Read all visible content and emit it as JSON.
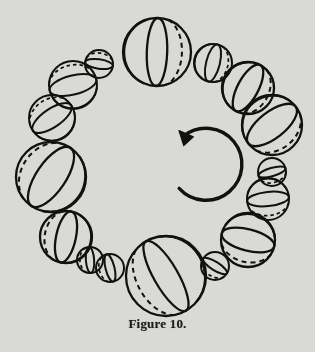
{
  "figure": {
    "caption": "Figure 10.",
    "title": "Figure 10.",
    "background_color": "#d9d9d6",
    "ink_color": "#111111",
    "rotation_arrow": {
      "name": "clockwise-rotation-arrow",
      "direction": "clockwise",
      "center_x": 157,
      "center_y": 160,
      "radius": 36,
      "gap_degrees": 40
    },
    "ring": {
      "center_x": 157,
      "center_y": 160,
      "radius": 110,
      "sphere_count": 20,
      "note": "Alternating large and small spheres; each sphere's great circle rotates progressively around the ring"
    },
    "spheres": [
      {
        "index": 0,
        "cx": 157,
        "cy": 52,
        "r": 34,
        "size": "large",
        "axis_tilt_deg": 2,
        "ellipse_ratio": 0.3,
        "second_line_ratio": 0.62,
        "label": "sphere-top-large"
      },
      {
        "index": 1,
        "cx": 213,
        "cy": 63,
        "r": 19,
        "size": "small",
        "axis_tilt_deg": 14,
        "ellipse_ratio": 0.36,
        "second_line_ratio": 0.7,
        "label": "sphere-small-1"
      },
      {
        "index": 2,
        "cx": 248,
        "cy": 88,
        "r": 26,
        "size": "large",
        "axis_tilt_deg": 28,
        "ellipse_ratio": 0.4,
        "second_line_ratio": 0.74,
        "label": "sphere-large-2"
      },
      {
        "index": 3,
        "cx": 272,
        "cy": 125,
        "r": 30,
        "size": "large",
        "axis_tilt_deg": 52,
        "ellipse_ratio": 0.44,
        "second_line_ratio": 0.78,
        "label": "sphere-large-3"
      },
      {
        "index": 4,
        "cx": 272,
        "cy": 172,
        "r": 14,
        "size": "small",
        "axis_tilt_deg": 74,
        "ellipse_ratio": 0.3,
        "second_line_ratio": 0.66,
        "label": "sphere-small-4"
      },
      {
        "index": 5,
        "cx": 268,
        "cy": 199,
        "r": 21,
        "size": "small",
        "axis_tilt_deg": 84,
        "ellipse_ratio": 0.34,
        "second_line_ratio": 0.7,
        "label": "sphere-small-5"
      },
      {
        "index": 6,
        "cx": 248,
        "cy": 240,
        "r": 27,
        "size": "large",
        "axis_tilt_deg": 104,
        "ellipse_ratio": 0.4,
        "second_line_ratio": 0.74,
        "label": "sphere-large-6"
      },
      {
        "index": 7,
        "cx": 215,
        "cy": 266,
        "r": 14,
        "size": "small",
        "axis_tilt_deg": 122,
        "ellipse_ratio": 0.3,
        "second_line_ratio": 0.66,
        "label": "sphere-small-7"
      },
      {
        "index": 8,
        "cx": 166,
        "cy": 276,
        "r": 40,
        "size": "large",
        "axis_tilt_deg": 150,
        "ellipse_ratio": 0.3,
        "second_line_ratio": 0.62,
        "label": "sphere-bottom-large"
      },
      {
        "index": 9,
        "cx": 110,
        "cy": 268,
        "r": 14,
        "size": "small",
        "axis_tilt_deg": 166,
        "ellipse_ratio": 0.32,
        "second_line_ratio": 0.68,
        "label": "sphere-small-9"
      },
      {
        "index": 10,
        "cx": 90,
        "cy": 260,
        "r": 13,
        "size": "small",
        "axis_tilt_deg": 176,
        "ellipse_ratio": 0.32,
        "second_line_ratio": 0.68,
        "label": "sphere-small-10"
      },
      {
        "index": 11,
        "cx": 66,
        "cy": 237,
        "r": 26,
        "size": "large",
        "axis_tilt_deg": 192,
        "ellipse_ratio": 0.38,
        "second_line_ratio": 0.74,
        "label": "sphere-large-11"
      },
      {
        "index": 12,
        "cx": 51,
        "cy": 177,
        "r": 35,
        "size": "large",
        "axis_tilt_deg": 214,
        "ellipse_ratio": 0.42,
        "second_line_ratio": 0.8,
        "label": "sphere-left-large"
      },
      {
        "index": 13,
        "cx": 52,
        "cy": 118,
        "r": 23,
        "size": "large",
        "axis_tilt_deg": 236,
        "ellipse_ratio": 0.4,
        "second_line_ratio": 0.76,
        "label": "sphere-large-13"
      },
      {
        "index": 14,
        "cx": 73,
        "cy": 85,
        "r": 24,
        "size": "large",
        "axis_tilt_deg": 256,
        "ellipse_ratio": 0.4,
        "second_line_ratio": 0.76,
        "label": "sphere-large-14"
      },
      {
        "index": 15,
        "cx": 99,
        "cy": 64,
        "r": 14,
        "size": "small",
        "axis_tilt_deg": 278,
        "ellipse_ratio": 0.34,
        "second_line_ratio": 0.7,
        "label": "sphere-small-15"
      },
      {
        "index": 16,
        "cx": 247,
        "cy": 61,
        "r": 0,
        "size": "hidden",
        "axis_tilt_deg": 0,
        "ellipse_ratio": 0.3,
        "second_line_ratio": 0.6,
        "label": "sphere-hidden-16"
      }
    ]
  }
}
